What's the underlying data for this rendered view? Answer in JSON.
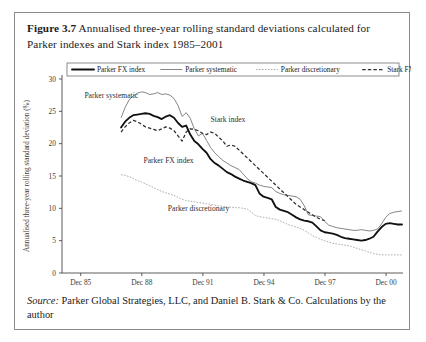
{
  "figure": {
    "number_label": "Figure 3.7",
    "caption": "Annualised three-year rolling standard deviations calculated for Parker indexes and Stark index 1985–2001"
  },
  "source_note": {
    "label": "Source:",
    "text": " Parker Global Strategies, LLC, and Daniel B. Stark & Co. Calculations by the author"
  },
  "chart_data": {
    "type": "line",
    "title": "Annualised three-year rolling standard deviations calculated for Parker indexes and Stark index 1985–2001",
    "xlabel": "",
    "ylabel": "Annualised three-year rolling standard deviation (%)",
    "ylim": [
      0,
      30
    ],
    "yticks": [
      0,
      5,
      10,
      15,
      20,
      25,
      30
    ],
    "ytick_labels": [
      "0",
      "5",
      "10",
      "15",
      "20",
      "25",
      "30"
    ],
    "xlim": [
      1985.0,
      2001.75
    ],
    "xticks": [
      1985.92,
      1988.92,
      1991.92,
      1994.92,
      1997.92,
      2000.92
    ],
    "xtick_labels": [
      "Dec 85",
      "Dec 88",
      "Dec 91",
      "Dec 94",
      "Dec 97",
      "Dec 00"
    ],
    "grid": false,
    "legend_position": "top-inside",
    "annotations": [
      {
        "text": "Parker systematic",
        "x": 1986.1,
        "y": 27.0
      },
      {
        "text": "Stark index",
        "x": 1992.3,
        "y": 23.3
      },
      {
        "text": "Parker FX index",
        "x": 1989.0,
        "y": 17.0
      },
      {
        "text": "Parker discretionary",
        "x": 1990.2,
        "y": 9.6
      }
    ],
    "series": [
      {
        "name": "Parker FX index",
        "style": "thick-solid",
        "color": "#111111",
        "x": [
          1987.9,
          1988.1,
          1988.3,
          1988.5,
          1988.7,
          1988.9,
          1989.1,
          1989.3,
          1989.5,
          1989.7,
          1989.9,
          1990.1,
          1990.3,
          1990.5,
          1990.7,
          1990.9,
          1991.1,
          1991.3,
          1991.5,
          1991.7,
          1991.9,
          1992.1,
          1992.3,
          1992.5,
          1992.7,
          1992.9,
          1993.1,
          1993.3,
          1993.5,
          1993.7,
          1993.9,
          1994.1,
          1994.3,
          1994.5,
          1994.7,
          1994.9,
          1995.1,
          1995.3,
          1995.5,
          1995.7,
          1995.9,
          1996.1,
          1996.3,
          1996.5,
          1996.7,
          1996.9,
          1997.1,
          1997.3,
          1997.5,
          1997.7,
          1997.9,
          1998.1,
          1998.3,
          1998.5,
          1998.7,
          1998.9,
          1999.1,
          1999.3,
          1999.5,
          1999.7,
          1999.9,
          2000.1,
          2000.3,
          2000.5,
          2000.7,
          2000.9,
          2001.1,
          2001.3,
          2001.5,
          2001.7
        ],
        "y": [
          22.5,
          23.4,
          24.0,
          24.4,
          24.5,
          24.6,
          24.7,
          24.6,
          24.3,
          24.1,
          23.8,
          24.2,
          24.4,
          24.0,
          23.2,
          22.6,
          22.8,
          21.4,
          20.4,
          19.9,
          19.2,
          18.6,
          17.6,
          17.0,
          16.6,
          16.1,
          15.6,
          15.3,
          14.9,
          14.6,
          14.3,
          14.1,
          13.9,
          13.6,
          12.3,
          11.8,
          11.6,
          11.4,
          10.2,
          9.8,
          9.6,
          9.4,
          9.0,
          8.6,
          8.3,
          8.1,
          8.0,
          7.8,
          7.2,
          6.6,
          6.3,
          6.2,
          6.1,
          5.9,
          5.6,
          5.4,
          5.3,
          5.2,
          5.1,
          5.0,
          5.1,
          5.3,
          5.6,
          6.4,
          7.1,
          7.6,
          7.7,
          7.6,
          7.5,
          7.5
        ]
      },
      {
        "name": "Parker systematic",
        "style": "thin-solid",
        "color": "#6f6f6f",
        "x": [
          1987.9,
          1988.1,
          1988.3,
          1988.5,
          1988.7,
          1988.9,
          1989.1,
          1989.3,
          1989.5,
          1989.7,
          1989.9,
          1990.1,
          1990.3,
          1990.5,
          1990.7,
          1990.9,
          1991.1,
          1991.3,
          1991.5,
          1991.7,
          1991.9,
          1992.1,
          1992.3,
          1992.5,
          1992.7,
          1992.9,
          1993.1,
          1993.3,
          1993.5,
          1993.7,
          1993.9,
          1994.1,
          1994.3,
          1994.5,
          1994.7,
          1994.9,
          1995.1,
          1995.3,
          1995.5,
          1995.7,
          1995.9,
          1996.1,
          1996.3,
          1996.5,
          1996.7,
          1996.9,
          1997.1,
          1997.3,
          1997.5,
          1997.7,
          1997.9,
          1998.1,
          1998.3,
          1998.5,
          1998.7,
          1998.9,
          1999.1,
          1999.3,
          1999.5,
          1999.7,
          1999.9,
          2000.1,
          2000.3,
          2000.5,
          2000.7,
          2000.9,
          2001.1,
          2001.3,
          2001.5,
          2001.7
        ],
        "y": [
          24.0,
          25.6,
          26.8,
          27.4,
          27.8,
          28.0,
          27.9,
          27.6,
          27.7,
          27.9,
          27.6,
          27.7,
          27.5,
          27.0,
          25.9,
          24.2,
          24.8,
          23.9,
          22.3,
          21.2,
          21.6,
          20.5,
          19.4,
          18.6,
          18.0,
          17.4,
          17.0,
          16.6,
          16.3,
          16.0,
          15.3,
          14.6,
          14.1,
          13.9,
          13.6,
          13.4,
          13.3,
          13.2,
          12.6,
          12.3,
          12.1,
          12.0,
          11.9,
          11.8,
          11.4,
          10.4,
          9.0,
          8.9,
          8.8,
          8.7,
          8.0,
          7.4,
          7.2,
          7.0,
          6.9,
          6.8,
          6.7,
          6.6,
          6.6,
          6.7,
          6.6,
          6.5,
          6.6,
          6.8,
          7.6,
          8.6,
          9.2,
          9.4,
          9.5,
          9.6
        ]
      },
      {
        "name": "Parker discretionary",
        "style": "dotted",
        "color": "#9d9d9d",
        "x": [
          1987.9,
          1988.1,
          1988.3,
          1988.5,
          1988.7,
          1988.9,
          1989.1,
          1989.3,
          1989.5,
          1989.7,
          1989.9,
          1990.1,
          1990.3,
          1990.5,
          1990.7,
          1990.9,
          1991.1,
          1991.3,
          1991.5,
          1991.7,
          1991.9,
          1992.1,
          1992.3,
          1992.5,
          1992.7,
          1992.9,
          1993.1,
          1993.3,
          1993.5,
          1993.7,
          1993.9,
          1994.1,
          1994.3,
          1994.5,
          1994.7,
          1994.9,
          1995.1,
          1995.3,
          1995.5,
          1995.7,
          1995.9,
          1996.1,
          1996.3,
          1996.5,
          1996.7,
          1996.9,
          1997.1,
          1997.3,
          1997.5,
          1997.7,
          1997.9,
          1998.1,
          1998.3,
          1998.5,
          1998.7,
          1998.9,
          1999.1,
          1999.3,
          1999.5,
          1999.7,
          1999.9,
          2000.1,
          2000.3,
          2000.5,
          2000.7,
          2000.9,
          2001.1,
          2001.3,
          2001.5,
          2001.7
        ],
        "y": [
          15.2,
          15.1,
          14.9,
          14.6,
          14.3,
          14.1,
          13.8,
          13.5,
          13.2,
          12.9,
          12.6,
          12.4,
          12.2,
          12.0,
          11.7,
          11.4,
          11.2,
          11.1,
          11.0,
          10.9,
          10.8,
          10.7,
          10.6,
          10.5,
          10.4,
          10.3,
          10.2,
          10.2,
          10.1,
          10.1,
          10.0,
          9.9,
          9.4,
          8.9,
          8.7,
          8.6,
          8.5,
          8.4,
          8.3,
          8.1,
          7.8,
          7.5,
          7.3,
          7.1,
          6.9,
          6.6,
          6.2,
          5.8,
          5.5,
          5.2,
          5.0,
          4.8,
          4.6,
          4.5,
          4.4,
          4.3,
          4.2,
          4.0,
          3.8,
          3.6,
          3.4,
          3.2,
          3.0,
          2.9,
          2.8,
          2.8,
          2.8,
          2.8,
          2.8,
          2.8
        ]
      },
      {
        "name": "Stark FX index",
        "style": "dashed",
        "color": "#2b2b2b",
        "x": [
          1987.9,
          1988.1,
          1988.3,
          1988.5,
          1988.7,
          1988.9,
          1989.1,
          1989.3,
          1989.5,
          1989.7,
          1989.9,
          1990.1,
          1990.3,
          1990.5,
          1990.7,
          1990.9,
          1991.1,
          1991.3,
          1991.5,
          1991.7,
          1991.9,
          1992.1,
          1992.3,
          1992.5,
          1992.7,
          1992.9,
          1993.1,
          1993.3,
          1993.5,
          1993.7,
          1993.9,
          1994.1,
          1994.3,
          1994.5,
          1994.7,
          1994.9,
          1995.1,
          1995.3,
          1995.5,
          1995.7,
          1995.9,
          1996.1,
          1996.3,
          1996.5,
          1996.7,
          1996.9,
          1997.1,
          1997.3,
          1997.5,
          1997.7,
          1997.9
        ],
        "y": [
          21.8,
          22.6,
          23.2,
          23.6,
          23.4,
          23.0,
          22.6,
          22.4,
          22.2,
          22.0,
          22.3,
          22.6,
          22.4,
          22.0,
          21.2,
          20.4,
          21.8,
          22.3,
          22.2,
          22.0,
          21.6,
          21.4,
          21.8,
          21.6,
          21.0,
          20.4,
          19.6,
          19.8,
          19.6,
          19.0,
          18.4,
          17.8,
          17.2,
          16.6,
          16.0,
          15.4,
          14.8,
          14.2,
          13.6,
          13.0,
          12.4,
          11.8,
          11.2,
          10.6,
          10.2,
          9.8,
          9.4,
          9.0,
          8.6,
          8.3,
          8.1
        ]
      }
    ]
  },
  "legend": {
    "items": [
      {
        "label": "Parker FX index",
        "style": "thick-solid"
      },
      {
        "label": "Parker systematic",
        "style": "thin-solid"
      },
      {
        "label": "Parker discretionary",
        "style": "dotted"
      },
      {
        "label": "Stark FX index",
        "style": "dashed"
      }
    ]
  }
}
